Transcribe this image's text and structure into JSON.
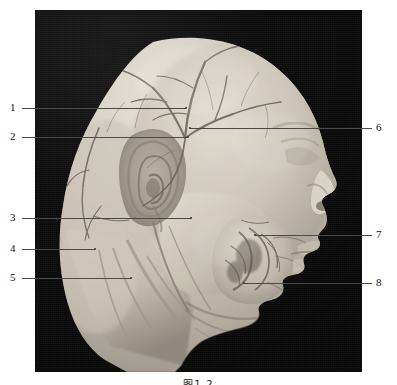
{
  "figure": {
    "type": "anatomical-photograph",
    "caption": "图1-2",
    "background_color": "#0a0a0a",
    "specimen_color": "#cfc9bd",
    "plate": {
      "x": 35,
      "y": 10,
      "width": 327,
      "height": 362
    }
  },
  "labels": {
    "left": [
      {
        "number": "1",
        "num_x": 10,
        "num_y": 102,
        "line_x": 22,
        "line_y": 108,
        "line_w": 164,
        "tip_x": 186,
        "tip_y": 108
      },
      {
        "number": "2",
        "num_x": 10,
        "num_y": 131,
        "line_x": 22,
        "line_y": 137,
        "line_w": 166,
        "tip_x": 188,
        "tip_y": 137
      },
      {
        "number": "3",
        "num_x": 10,
        "num_y": 212,
        "line_x": 22,
        "line_y": 218,
        "line_w": 169,
        "tip_x": 191,
        "tip_y": 218
      },
      {
        "number": "4",
        "num_x": 10,
        "num_y": 243,
        "line_x": 22,
        "line_y": 249,
        "line_w": 73,
        "tip_x": 95,
        "tip_y": 249
      },
      {
        "number": "5",
        "num_x": 10,
        "num_y": 272,
        "line_x": 22,
        "line_y": 278,
        "line_w": 109,
        "tip_x": 131,
        "tip_y": 278
      }
    ],
    "right": [
      {
        "number": "6",
        "num_x": 376,
        "num_y": 122,
        "line_x": 190,
        "line_y": 128,
        "line_w": 182,
        "tip_x": 190,
        "tip_y": 128
      },
      {
        "number": "7",
        "num_x": 376,
        "num_y": 229,
        "line_x": 255,
        "line_y": 235,
        "line_w": 117,
        "tip_x": 255,
        "tip_y": 235
      },
      {
        "number": "8",
        "num_x": 376,
        "num_y": 277,
        "line_x": 244,
        "line_y": 283,
        "line_w": 128,
        "tip_x": 244,
        "tip_y": 283
      }
    ]
  }
}
